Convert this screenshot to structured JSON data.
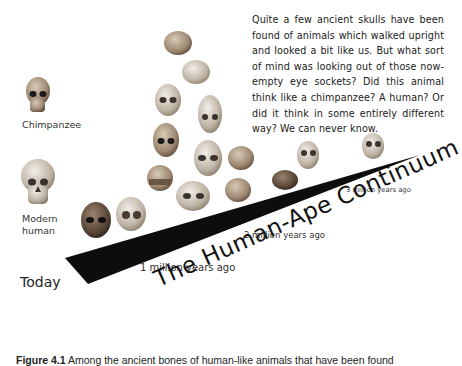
{
  "figure": {
    "quote_text": "Quite a few ancient skulls have been found of animals which walked upright and looked a bit like us. But what sort of mind was looking out of those now-empty eye sockets? Did this animal think like a chimpanzee? A human? Or did it think in some entirely different way? We can never know.",
    "labels": {
      "chimpanzee": "Chimpanzee",
      "modern_human_line1": "Modern",
      "modern_human_line2": "human",
      "today": "Today",
      "one_million": "1 million years ago",
      "two_million": "2 million years ago",
      "three_million": "3 million years ago"
    },
    "title": "The Human-Ape Continuum",
    "caption_label": "Figure 4.1",
    "caption_text": "Among the ancient bones of human-like animals that have been found"
  },
  "colors": {
    "wedge": "#0d0d0d",
    "background": "#ffffff",
    "skull_light": "#d9d2c6",
    "skull_mid": "#a89680",
    "skull_dark": "#5a4a3a"
  }
}
